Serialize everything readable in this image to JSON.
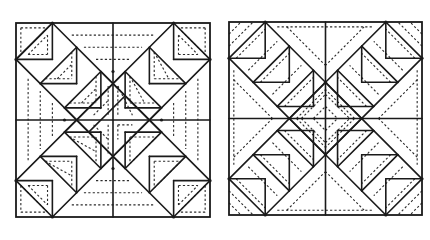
{
  "figure": {
    "colors": {
      "line": "#1a1a1a",
      "background": "#ffffff"
    },
    "grid_units": 8
  },
  "blocks": [
    {
      "id": "left-block",
      "x": 16,
      "y": 23,
      "size": 194,
      "solid": [
        [
          0,
          4,
          8,
          4
        ],
        [
          4,
          0,
          4,
          8
        ],
        [
          0,
          1.5,
          1.5,
          0
        ],
        [
          1.5,
          0,
          1.5,
          1.5
        ],
        [
          0,
          1.5,
          1.5,
          1.5
        ],
        [
          1.5,
          0,
          6,
          4.5
        ],
        [
          0,
          1.5,
          4.5,
          6
        ],
        [
          1.5,
          0,
          0,
          1.5
        ],
        [
          1,
          2.5,
          2.5,
          1
        ],
        [
          2.5,
          1,
          2.5,
          2.5
        ],
        [
          1,
          2.5,
          2.5,
          2.5
        ],
        [
          2,
          3.5,
          3.5,
          2
        ],
        [
          3.5,
          2,
          3.5,
          3.5
        ],
        [
          2,
          3.5,
          3.5,
          3.5
        ],
        [
          3,
          4.5,
          4.5,
          3
        ],
        [
          8,
          1.5,
          6.5,
          0
        ],
        [
          6.5,
          0,
          6.5,
          1.5
        ],
        [
          6.5,
          1.5,
          8,
          1.5
        ],
        [
          6.5,
          0,
          2,
          4.5
        ],
        [
          8,
          1.5,
          3.5,
          6
        ],
        [
          7,
          2.5,
          5.5,
          1
        ],
        [
          5.5,
          1,
          5.5,
          2.5
        ],
        [
          5.5,
          2.5,
          7,
          2.5
        ],
        [
          6,
          3.5,
          4.5,
          2
        ],
        [
          4.5,
          2,
          4.5,
          3.5
        ],
        [
          4.5,
          3.5,
          6,
          3.5
        ],
        [
          0,
          6.5,
          1.5,
          8
        ],
        [
          1.5,
          6.5,
          1.5,
          8
        ],
        [
          0,
          6.5,
          1.5,
          6.5
        ],
        [
          1.5,
          8,
          6,
          3.5
        ],
        [
          0,
          6.5,
          4.5,
          2
        ],
        [
          1,
          5.5,
          2.5,
          7
        ],
        [
          2.5,
          5.5,
          2.5,
          7
        ],
        [
          1,
          5.5,
          2.5,
          5.5
        ],
        [
          2,
          4.5,
          3.5,
          6
        ],
        [
          3.5,
          4.5,
          3.5,
          6
        ],
        [
          2,
          4.5,
          3.5,
          4.5
        ],
        [
          8,
          6.5,
          6.5,
          8
        ],
        [
          6.5,
          6.5,
          6.5,
          8
        ],
        [
          6.5,
          6.5,
          8,
          6.5
        ],
        [
          6.5,
          8,
          2,
          3.5
        ],
        [
          8,
          6.5,
          3.5,
          2
        ],
        [
          7,
          5.5,
          5.5,
          7
        ],
        [
          5.5,
          5.5,
          5.5,
          7
        ],
        [
          5.5,
          5.5,
          7,
          5.5
        ],
        [
          6,
          4.5,
          4.5,
          6
        ],
        [
          4.5,
          4.5,
          4.5,
          6
        ],
        [
          4.5,
          4.5,
          6,
          4.5
        ]
      ],
      "dashed": [
        [
          0.2,
          0.2,
          1.3,
          0.2
        ],
        [
          0.2,
          0.2,
          0.2,
          1.3
        ],
        [
          0.2,
          1.3,
          1.3,
          0.2
        ],
        [
          0.5,
          1.3,
          1.3,
          0.5
        ],
        [
          1.3,
          0.5,
          1.3,
          1.3
        ],
        [
          0.5,
          1.3,
          1.3,
          1.3
        ],
        [
          1.7,
          2.3,
          2.3,
          1.7
        ],
        [
          2.3,
          1.2,
          2.3,
          2.3
        ],
        [
          1.2,
          2.3,
          2.3,
          2.3
        ],
        [
          2.7,
          3.3,
          3.3,
          2.7
        ],
        [
          3.3,
          2.2,
          3.3,
          3.3
        ],
        [
          2.2,
          3.3,
          3.3,
          3.3
        ],
        [
          3.2,
          3.8,
          3.8,
          3.2
        ],
        [
          3.8,
          2.6,
          3.8,
          3.8
        ],
        [
          2.3,
          0.5,
          5.7,
          0.5
        ],
        [
          2.8,
          1.0,
          5.2,
          1.0
        ],
        [
          3.3,
          1.5,
          4.7,
          1.5
        ],
        [
          6.8,
          0.2,
          7.8,
          0.2
        ],
        [
          7.8,
          0.2,
          7.8,
          1.3
        ],
        [
          6.7,
          0.2,
          7.8,
          1.3
        ],
        [
          6.7,
          0.5,
          7.5,
          1.3
        ],
        [
          6.7,
          0.5,
          6.7,
          1.3
        ],
        [
          6.7,
          1.3,
          7.5,
          1.3
        ],
        [
          5.7,
          1.2,
          6.3,
          2.3
        ],
        [
          5.7,
          1.2,
          5.7,
          2.3
        ],
        [
          5.7,
          2.3,
          6.8,
          2.3
        ],
        [
          4.7,
          2.2,
          5.3,
          3.3
        ],
        [
          4.7,
          2.2,
          4.7,
          3.3
        ],
        [
          4.7,
          3.3,
          5.8,
          3.3
        ],
        [
          4.2,
          2.6,
          4.8,
          3.8
        ],
        [
          4.2,
          2.6,
          4.2,
          3.8
        ],
        [
          0.5,
          2.3,
          0.5,
          5.7
        ],
        [
          1.0,
          2.8,
          1.0,
          5.2
        ],
        [
          1.5,
          3.3,
          1.5,
          4.7
        ],
        [
          7.5,
          2.3,
          7.5,
          5.7
        ],
        [
          7.0,
          2.8,
          7.0,
          5.2
        ],
        [
          6.5,
          3.3,
          6.5,
          4.7
        ],
        [
          0.2,
          6.7,
          0.2,
          7.8
        ],
        [
          0.2,
          7.8,
          1.3,
          7.8
        ],
        [
          0.2,
          6.7,
          1.3,
          7.8
        ],
        [
          0.5,
          6.7,
          1.3,
          7.5
        ],
        [
          1.3,
          6.7,
          1.3,
          7.5
        ],
        [
          0.5,
          6.7,
          1.3,
          6.7
        ],
        [
          1.2,
          5.7,
          2.3,
          6.3
        ],
        [
          2.3,
          5.7,
          2.3,
          6.8
        ],
        [
          1.2,
          5.7,
          2.3,
          5.7
        ],
        [
          2.2,
          4.7,
          3.3,
          5.3
        ],
        [
          3.3,
          4.7,
          3.3,
          5.8
        ],
        [
          2.2,
          4.7,
          3.3,
          4.7
        ],
        [
          3.2,
          4.2,
          3.8,
          4.8
        ],
        [
          3.8,
          4.2,
          3.8,
          5.4
        ],
        [
          2.3,
          7.5,
          5.7,
          7.5
        ],
        [
          2.8,
          7.0,
          5.2,
          7.0
        ],
        [
          3.3,
          6.5,
          4.7,
          6.5
        ],
        [
          6.8,
          7.8,
          7.8,
          7.8
        ],
        [
          7.8,
          6.7,
          7.8,
          7.8
        ],
        [
          6.7,
          7.8,
          7.8,
          6.7
        ],
        [
          6.7,
          6.7,
          7.5,
          6.7
        ],
        [
          6.7,
          6.7,
          6.7,
          7.5
        ],
        [
          6.7,
          7.5,
          7.5,
          6.7
        ],
        [
          5.7,
          5.7,
          6.8,
          5.7
        ],
        [
          5.7,
          5.7,
          5.7,
          6.8
        ],
        [
          5.7,
          6.8,
          6.8,
          5.7
        ],
        [
          4.7,
          4.7,
          5.8,
          4.7
        ],
        [
          4.7,
          4.7,
          4.7,
          5.8
        ],
        [
          4.7,
          5.8,
          5.8,
          4.7
        ],
        [
          4.2,
          4.2,
          4.8,
          4.2
        ],
        [
          4.2,
          4.2,
          4.2,
          4.8
        ]
      ],
      "vertices": [
        [
          4,
          2
        ],
        [
          4,
          6
        ],
        [
          2,
          4
        ],
        [
          6,
          4
        ],
        [
          1.5,
          0
        ],
        [
          6.5,
          0
        ],
        [
          0,
          1.5
        ],
        [
          8,
          1.5
        ],
        [
          0,
          6.5
        ],
        [
          8,
          6.5
        ],
        [
          1.5,
          8
        ],
        [
          6.5,
          8
        ]
      ]
    },
    {
      "id": "right-block",
      "x": 229,
      "y": 22,
      "size": 193,
      "solid": [
        [
          0,
          4,
          8,
          4
        ],
        [
          4,
          0,
          4,
          8
        ],
        [
          1.5,
          0,
          0,
          1.5
        ],
        [
          1.5,
          0,
          1.5,
          1.5
        ],
        [
          0,
          1.5,
          1.5,
          1.5
        ],
        [
          1.5,
          0,
          5.5,
          4
        ],
        [
          0,
          1.5,
          4,
          5.5
        ],
        [
          1,
          2.5,
          2.5,
          1
        ],
        [
          2.5,
          1,
          2.5,
          2.5
        ],
        [
          1,
          2.5,
          2.5,
          2.5
        ],
        [
          2,
          3.5,
          3.5,
          2
        ],
        [
          3.5,
          2,
          3.5,
          3.5
        ],
        [
          2,
          3.5,
          3.5,
          3.5
        ],
        [
          6.5,
          0,
          8,
          1.5
        ],
        [
          6.5,
          0,
          6.5,
          1.5
        ],
        [
          6.5,
          1.5,
          8,
          1.5
        ],
        [
          6.5,
          0,
          2.5,
          4
        ],
        [
          8,
          1.5,
          4,
          5.5
        ],
        [
          5.5,
          1,
          7,
          2.5
        ],
        [
          5.5,
          1,
          5.5,
          2.5
        ],
        [
          5.5,
          2.5,
          7,
          2.5
        ],
        [
          4.5,
          2,
          6,
          3.5
        ],
        [
          4.5,
          2,
          4.5,
          3.5
        ],
        [
          4.5,
          3.5,
          6,
          3.5
        ],
        [
          0,
          6.5,
          1.5,
          8
        ],
        [
          1.5,
          6.5,
          1.5,
          8
        ],
        [
          0,
          6.5,
          1.5,
          6.5
        ],
        [
          1.5,
          8,
          5.5,
          4
        ],
        [
          0,
          6.5,
          4,
          2.5
        ],
        [
          1,
          5.5,
          2.5,
          7
        ],
        [
          2.5,
          5.5,
          2.5,
          7
        ],
        [
          1,
          5.5,
          2.5,
          5.5
        ],
        [
          2,
          4.5,
          3.5,
          6
        ],
        [
          3.5,
          4.5,
          3.5,
          6
        ],
        [
          2,
          4.5,
          3.5,
          4.5
        ],
        [
          8,
          6.5,
          6.5,
          8
        ],
        [
          6.5,
          6.5,
          6.5,
          8
        ],
        [
          6.5,
          6.5,
          8,
          6.5
        ],
        [
          6.5,
          8,
          2.5,
          4
        ],
        [
          8,
          6.5,
          4,
          2.5
        ],
        [
          7,
          5.5,
          5.5,
          7
        ],
        [
          5.5,
          5.5,
          5.5,
          7
        ],
        [
          5.5,
          5.5,
          7,
          5.5
        ],
        [
          6,
          4.5,
          4.5,
          6
        ],
        [
          4.5,
          4.5,
          4.5,
          6
        ],
        [
          4.5,
          4.5,
          6,
          4.5
        ]
      ],
      "dashed": [
        [
          0,
          0.5,
          0.5,
          0
        ],
        [
          0,
          1.0,
          1.0,
          0
        ],
        [
          0.3,
          1.5,
          1.5,
          0.3
        ],
        [
          0.8,
          2.0,
          2.0,
          0.8
        ],
        [
          1.3,
          2.5,
          2.5,
          1.3
        ],
        [
          1.8,
          3.0,
          3.0,
          1.8
        ],
        [
          2.3,
          3.5,
          3.5,
          2.3
        ],
        [
          2.8,
          4.0,
          4.0,
          2.8
        ],
        [
          8,
          0.5,
          7.5,
          0
        ],
        [
          8,
          1.0,
          7.0,
          0
        ],
        [
          7.7,
          1.5,
          6.5,
          0.3
        ],
        [
          7.2,
          2.0,
          6.0,
          0.8
        ],
        [
          6.7,
          2.5,
          5.5,
          1.3
        ],
        [
          6.2,
          3.0,
          5.0,
          1.8
        ],
        [
          5.7,
          3.5,
          4.5,
          2.3
        ],
        [
          5.2,
          4.0,
          4.0,
          2.8
        ],
        [
          0,
          7.5,
          0.5,
          8
        ],
        [
          0,
          7.0,
          1.0,
          8
        ],
        [
          0.3,
          6.5,
          1.5,
          7.7
        ],
        [
          0.8,
          6.0,
          2.0,
          7.2
        ],
        [
          1.3,
          5.5,
          2.5,
          6.7
        ],
        [
          1.8,
          5.0,
          3.0,
          6.2
        ],
        [
          2.3,
          4.5,
          3.5,
          5.7
        ],
        [
          2.8,
          4.0,
          4.0,
          5.2
        ],
        [
          8,
          7.5,
          7.5,
          8
        ],
        [
          8,
          7.0,
          7.0,
          8
        ],
        [
          7.7,
          6.5,
          6.5,
          7.7
        ],
        [
          7.2,
          6.0,
          6.0,
          7.2
        ],
        [
          6.7,
          5.5,
          5.5,
          6.7
        ],
        [
          6.2,
          5.0,
          5.0,
          6.2
        ],
        [
          5.7,
          4.5,
          4.5,
          5.7
        ],
        [
          5.2,
          4.0,
          4.0,
          5.2
        ],
        [
          3.0,
          4.0,
          4.0,
          3.0
        ],
        [
          3.5,
          4.0,
          4.0,
          3.5
        ],
        [
          4.0,
          3.0,
          5.0,
          4.0
        ],
        [
          4.0,
          3.5,
          4.5,
          4.0
        ],
        [
          3.0,
          4.0,
          4.0,
          5.0
        ],
        [
          3.5,
          4.0,
          4.0,
          4.5
        ],
        [
          4.0,
          5.0,
          5.0,
          4.0
        ],
        [
          4.0,
          4.5,
          4.5,
          4.0
        ],
        [
          2.0,
          0.2,
          6.0,
          0.2
        ],
        [
          2.4,
          0.2,
          4.0,
          1.8
        ],
        [
          5.6,
          0.2,
          4.0,
          1.8
        ],
        [
          2.0,
          7.8,
          6.0,
          7.8
        ],
        [
          2.4,
          7.8,
          4.0,
          6.2
        ],
        [
          5.6,
          7.8,
          4.0,
          6.2
        ],
        [
          0.2,
          2.0,
          0.2,
          6.0
        ],
        [
          0.2,
          2.4,
          1.8,
          4.0
        ],
        [
          0.2,
          5.6,
          1.8,
          4.0
        ],
        [
          7.8,
          2.0,
          7.8,
          6.0
        ],
        [
          7.8,
          2.4,
          6.2,
          4.0
        ],
        [
          7.8,
          5.6,
          6.2,
          4.0
        ]
      ],
      "vertices": [
        [
          4,
          2.5
        ],
        [
          4,
          5.5
        ],
        [
          2.5,
          4
        ],
        [
          5.5,
          4
        ],
        [
          1.5,
          0
        ],
        [
          6.5,
          0
        ],
        [
          0,
          1.5
        ],
        [
          8,
          1.5
        ],
        [
          0,
          6.5
        ],
        [
          8,
          6.5
        ],
        [
          1.5,
          8
        ],
        [
          6.5,
          8
        ]
      ]
    }
  ]
}
